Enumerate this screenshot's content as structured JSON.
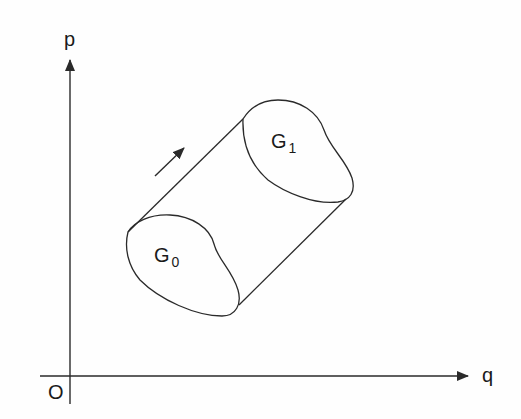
{
  "figure": {
    "axes": {
      "x_label": "q",
      "y_label": "p",
      "origin_label": "O"
    },
    "regions": [
      {
        "name": "G",
        "subscript": "0",
        "role": "initial region"
      },
      {
        "name": "G",
        "subscript": "1",
        "role": "evolved region"
      }
    ],
    "flow_arrow": "direction of phase flow",
    "colors": {
      "stroke": "#2a2a2a",
      "text": "#1a1a1a",
      "background": "#fefefe"
    }
  }
}
